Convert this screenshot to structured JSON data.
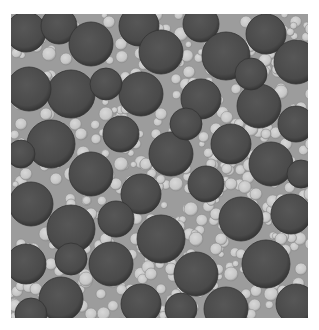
{
  "image": {
    "subject": "bimodal sphere packing rendering",
    "box": {
      "x": 11,
      "y": 14,
      "width": 297,
      "height": 304
    },
    "colors": {
      "background": "#9c9c9c",
      "large_sphere": "#4c4c4c",
      "large_sphere_edge": "#333333",
      "small_sphere": "#c9c9c9",
      "small_sphere_edge": "#8a8a8a"
    },
    "large_spheres": [
      [
        15,
        18,
        20
      ],
      [
        48,
        12,
        18
      ],
      [
        80,
        30,
        22
      ],
      [
        128,
        12,
        20
      ],
      [
        150,
        38,
        22
      ],
      [
        190,
        10,
        18
      ],
      [
        215,
        42,
        24
      ],
      [
        255,
        20,
        20
      ],
      [
        285,
        48,
        22
      ],
      [
        60,
        80,
        24
      ],
      [
        18,
        75,
        22
      ],
      [
        130,
        80,
        22
      ],
      [
        190,
        85,
        20
      ],
      [
        248,
        92,
        22
      ],
      [
        110,
        120,
        18
      ],
      [
        40,
        130,
        24
      ],
      [
        160,
        140,
        22
      ],
      [
        220,
        130,
        20
      ],
      [
        285,
        110,
        18
      ],
      [
        80,
        160,
        22
      ],
      [
        20,
        190,
        22
      ],
      [
        130,
        180,
        20
      ],
      [
        195,
        170,
        18
      ],
      [
        260,
        150,
        22
      ],
      [
        60,
        215,
        24
      ],
      [
        150,
        225,
        24
      ],
      [
        230,
        205,
        22
      ],
      [
        280,
        200,
        20
      ],
      [
        15,
        250,
        20
      ],
      [
        100,
        250,
        22
      ],
      [
        185,
        260,
        22
      ],
      [
        255,
        250,
        24
      ],
      [
        50,
        285,
        22
      ],
      [
        130,
        290,
        20
      ],
      [
        215,
        295,
        22
      ],
      [
        285,
        290,
        20
      ],
      [
        20,
        300,
        16
      ],
      [
        105,
        205,
        18
      ],
      [
        240,
        60,
        16
      ],
      [
        95,
        70,
        16
      ],
      [
        175,
        110,
        16
      ],
      [
        60,
        245,
        16
      ],
      [
        290,
        160,
        14
      ],
      [
        170,
        295,
        16
      ],
      [
        10,
        140,
        14
      ]
    ],
    "small_spheres": [
      [
        38,
        40,
        7
      ],
      [
        98,
        8,
        6
      ],
      [
        110,
        30,
        6
      ],
      [
        170,
        20,
        7
      ],
      [
        178,
        58,
        6
      ],
      [
        235,
        8,
        6
      ],
      [
        270,
        78,
        7
      ],
      [
        300,
        15,
        6
      ],
      [
        300,
        80,
        6
      ],
      [
        35,
        100,
        6
      ],
      [
        10,
        110,
        6
      ],
      [
        95,
        100,
        7
      ],
      [
        110,
        150,
        7
      ],
      [
        150,
        100,
        6
      ],
      [
        165,
        65,
        5
      ],
      [
        205,
        115,
        6
      ],
      [
        240,
        115,
        7
      ],
      [
        300,
        130,
        6
      ],
      [
        275,
        130,
        6
      ],
      [
        135,
        150,
        6
      ],
      [
        60,
        160,
        7
      ],
      [
        45,
        165,
        6
      ],
      [
        105,
        170,
        6
      ],
      [
        165,
        170,
        7
      ],
      [
        220,
        170,
        6
      ],
      [
        245,
        180,
        6
      ],
      [
        300,
        180,
        7
      ],
      [
        115,
        195,
        6
      ],
      [
        180,
        195,
        7
      ],
      [
        205,
        200,
        6
      ],
      [
        80,
        200,
        6
      ],
      [
        35,
        220,
        7
      ],
      [
        95,
        225,
        6
      ],
      [
        125,
        225,
        6
      ],
      [
        185,
        225,
        7
      ],
      [
        205,
        235,
        6
      ],
      [
        270,
        225,
        6
      ],
      [
        300,
        230,
        6
      ],
      [
        40,
        250,
        6
      ],
      [
        75,
        265,
        7
      ],
      [
        140,
        260,
        6
      ],
      [
        160,
        255,
        6
      ],
      [
        220,
        260,
        7
      ],
      [
        290,
        255,
        6
      ],
      [
        25,
        275,
        6
      ],
      [
        80,
        300,
        6
      ],
      [
        110,
        310,
        6
      ],
      [
        155,
        312,
        6
      ],
      [
        190,
        315,
        7
      ],
      [
        245,
        315,
        6
      ],
      [
        260,
        280,
        7
      ],
      [
        300,
        310,
        6
      ],
      [
        125,
        60,
        6
      ],
      [
        200,
        55,
        6
      ],
      [
        55,
        45,
        6
      ],
      [
        70,
        120,
        6
      ],
      [
        125,
        130,
        5
      ],
      [
        255,
        120,
        5
      ],
      [
        180,
        240,
        5
      ],
      [
        230,
        240,
        5
      ],
      [
        60,
        190,
        5
      ],
      [
        15,
        160,
        6
      ],
      [
        140,
        205,
        5
      ],
      [
        270,
        185,
        5
      ],
      [
        50,
        305,
        5
      ],
      [
        235,
        280,
        5
      ],
      [
        165,
        280,
        5
      ],
      [
        90,
        280,
        5
      ],
      [
        300,
        60,
        5
      ],
      [
        225,
        75,
        5
      ],
      [
        115,
        95,
        5
      ],
      [
        85,
        125,
        5
      ],
      [
        145,
        120,
        5
      ],
      [
        175,
        155,
        5
      ],
      [
        40,
        150,
        5
      ],
      [
        260,
        165,
        5
      ],
      [
        200,
        150,
        5
      ],
      [
        150,
        275,
        5
      ],
      [
        75,
        235,
        5
      ],
      [
        10,
        230,
        5
      ]
    ]
  }
}
